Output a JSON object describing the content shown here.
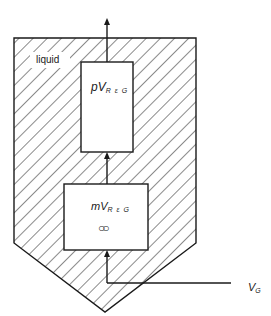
{
  "diagram": {
    "region_label": "liquid",
    "upper_box": {
      "main": "pV",
      "subscript": "R ε G"
    },
    "lower_box": {
      "main": "mV",
      "subscript": "R ε G",
      "symbol": "○○"
    },
    "input_label": {
      "main": "V",
      "subscript": "G"
    },
    "colors": {
      "line": "#1a1a1a",
      "hatch": "#2a2a2a",
      "background": "#ffffff"
    }
  }
}
